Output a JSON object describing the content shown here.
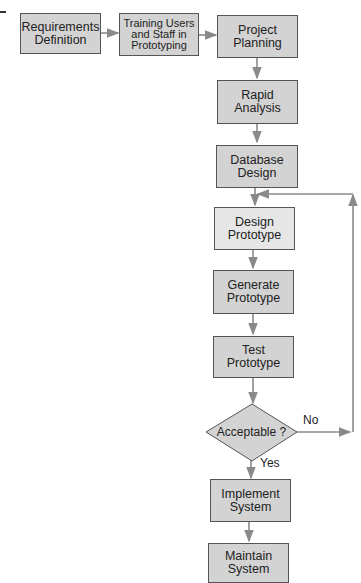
{
  "diagram": {
    "type": "flowchart",
    "edge_fragment": "-\n)",
    "nodes": [
      {
        "id": "req",
        "label": "Requirements\nDefinition"
      },
      {
        "id": "train",
        "label": "Training Users\nand Staff in\nPrototyping"
      },
      {
        "id": "plan",
        "label": "Project\nPlanning"
      },
      {
        "id": "rapid",
        "label": "Rapid\nAnalysis"
      },
      {
        "id": "db",
        "label": "Database\nDesign"
      },
      {
        "id": "design",
        "label": "Design\nPrototype"
      },
      {
        "id": "generate",
        "label": "Generate\nPrototype"
      },
      {
        "id": "test",
        "label": "Test\nPrototype"
      },
      {
        "id": "decision",
        "label": "Acceptable ?"
      },
      {
        "id": "implement",
        "label": "Implement\nSystem"
      },
      {
        "id": "maintain",
        "label": "Maintain\nSystem"
      }
    ],
    "edge_labels": {
      "no": "No",
      "yes": "Yes"
    },
    "colors": {
      "box_fill": "#d3d3d3",
      "box_fill_light": "#e6e6e6",
      "border": "#555555",
      "arrow": "#8a8a8a"
    }
  }
}
